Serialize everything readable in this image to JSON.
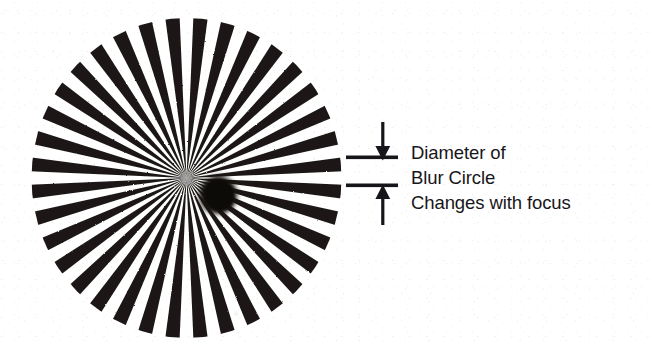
{
  "figure": {
    "type": "optical-test-chart",
    "title_text": null,
    "background_color": "#ffffff",
    "ink_color": "#17151a"
  },
  "star": {
    "name": "siemens-star",
    "description": "Radial spoke resolution test pattern (Siemens star)",
    "spoke_count": 36,
    "sector_count": 72,
    "center_x": 186,
    "center_y": 178,
    "radius": 155,
    "spoke_color": "#1a1713",
    "gap_color": "#ffffff",
    "blur_circle": {
      "name": "blur-circle",
      "center_x": 187,
      "center_y": 177,
      "radius": 19,
      "color": "#0d0b08"
    },
    "artifact_speck": {
      "x": 205,
      "y": 295,
      "radius": 2,
      "color": "#f6f4f1"
    }
  },
  "callout": {
    "arrow_down": {
      "name": "arrow-down",
      "label": "down-arrow",
      "shaft_top_y": 122,
      "tip_y": 160
    },
    "arrow_up": {
      "name": "arrow-up",
      "label": "up-arrow",
      "shaft_bottom_y": 226,
      "tip_y": 184
    },
    "leader_line_upper": {
      "name": "leader-line-upper",
      "x_start": 348,
      "x_end": 398,
      "y": 158
    },
    "leader_line_lower": {
      "name": "leader-line-lower",
      "x_start": 348,
      "x_end": 398,
      "y": 186
    },
    "lines": [
      "Diameter of",
      "Blur Circle",
      "Changes with focus"
    ]
  },
  "chart_data": {
    "type": "other",
    "annotations": [
      "Diameter of",
      "Blur Circle",
      "Changes with focus"
    ],
    "spokes": 36,
    "xlabel": "",
    "ylabel": ""
  }
}
